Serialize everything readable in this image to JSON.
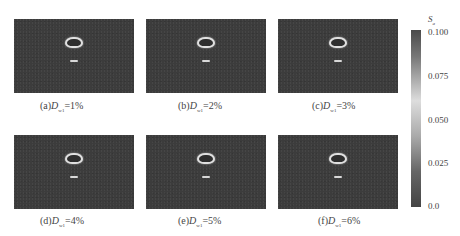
{
  "figure": {
    "panels": [
      {
        "label": "(a)",
        "var": "D",
        "sub": "w1",
        "value": "=1%"
      },
      {
        "label": "(b)",
        "var": "D",
        "sub": "w1",
        "value": "=2%"
      },
      {
        "label": "(c)",
        "var": "D",
        "sub": "w1",
        "value": "=3%"
      },
      {
        "label": "(d)",
        "var": "D",
        "sub": "w1",
        "value": "=4%"
      },
      {
        "label": "(e)",
        "var": "D",
        "sub": "w1",
        "value": "=5%"
      },
      {
        "label": "(f)",
        "var": "D",
        "sub": "w1",
        "value": "=6%"
      }
    ],
    "colorbar": {
      "title": "S",
      "title_sub": "a",
      "ticks": [
        "0.100",
        "0.075",
        "0.050",
        "0.025",
        "0.0"
      ]
    }
  }
}
